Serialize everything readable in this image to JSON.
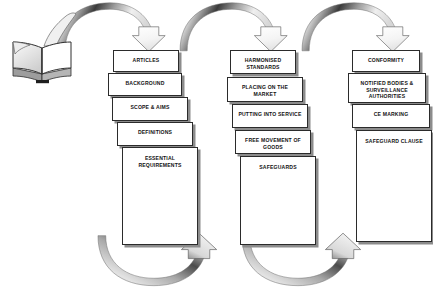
{
  "diagram": {
    "background_color": "#ffffff",
    "card_border_color": "#2b2b2b",
    "card_fill_color": "#ffffff",
    "card_shadow_color": "#8c8c8c",
    "text_color": "#121212",
    "arrow_fill_light": "#f2f2f2",
    "arrow_fill_dark": "#4a4a4a",
    "source_icon": "open-book-icon",
    "columns": [
      {
        "name": "column-1",
        "cards": [
          {
            "label": "ARTICLES"
          },
          {
            "label": "BACKGROUND"
          },
          {
            "label": "SCOPE & AIMS"
          },
          {
            "label": "DEFINITIONS"
          },
          {
            "label": "ESSENTIAL REQUIREMENTS"
          }
        ]
      },
      {
        "name": "column-2",
        "cards": [
          {
            "label": "HARMONISED STANDARDS"
          },
          {
            "label": "PLACING ON THE MARKET"
          },
          {
            "label": "PUTTING INTO SERVICE"
          },
          {
            "label": "FREE MOVEMENT OF GOODS"
          },
          {
            "label": "SAFEGUARDS"
          }
        ]
      },
      {
        "name": "column-3",
        "cards": [
          {
            "label": "CONFORMITY"
          },
          {
            "label": "NOTIFIED BODIES & SURVEILLANCE AUTHORITIES"
          },
          {
            "label": "CE MARKING"
          },
          {
            "label": "SAFEGUARD CLAUSE"
          }
        ]
      }
    ],
    "top_arrows": [
      {
        "name": "top-arrow-1",
        "direction": "down"
      },
      {
        "name": "top-arrow-2",
        "direction": "down"
      },
      {
        "name": "top-arrow-3",
        "direction": "down"
      }
    ],
    "bottom_arrows": [
      {
        "name": "bottom-arrow-1",
        "direction": "up-right"
      },
      {
        "name": "bottom-arrow-2",
        "direction": "up-right"
      }
    ]
  }
}
